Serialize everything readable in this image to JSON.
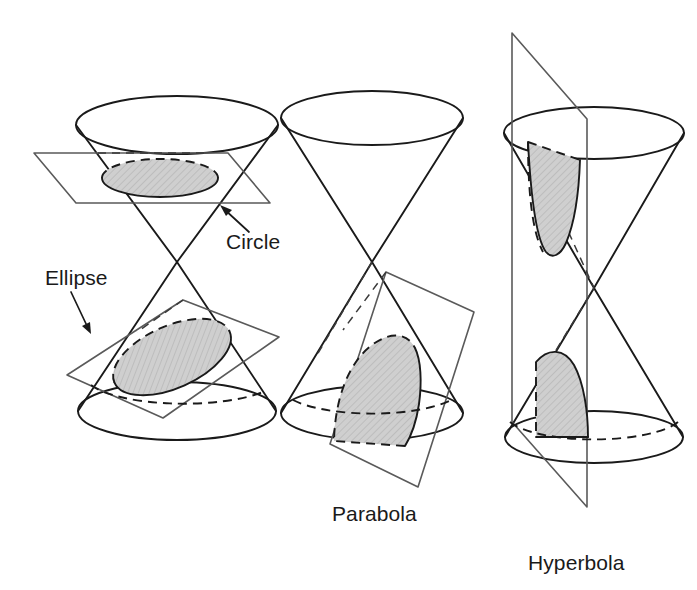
{
  "figure": {
    "background_color": "#ffffff",
    "line_color": "#1a1a1a",
    "plane_color": "#5a5a5a",
    "shade_color": "#c8c8c8",
    "panels": [
      {
        "id": "panel-circle-ellipse",
        "labels": [
          {
            "name": "circle-label",
            "text": "Circle",
            "x": 226,
            "y": 249,
            "anchor": "start"
          },
          {
            "name": "ellipse-label",
            "text": "Ellipse",
            "x": 45,
            "y": 285,
            "anchor": "start"
          }
        ],
        "leaders": [
          {
            "name": "circle-leader",
            "from_x": 249,
            "from_y": 232,
            "to_x": 222,
            "to_y": 206
          },
          {
            "name": "ellipse-leader",
            "from_x": 71,
            "from_y": 292,
            "to_x": 90,
            "to_y": 332
          }
        ],
        "cross_sections": [
          {
            "name": "circle-cross-section",
            "shape": "circle"
          },
          {
            "name": "ellipse-cross-section",
            "shape": "ellipse"
          }
        ],
        "planes": [
          {
            "name": "horizontal-cutting-plane"
          },
          {
            "name": "tilted-cutting-plane"
          }
        ]
      },
      {
        "id": "panel-parabola",
        "labels": [
          {
            "name": "parabola-label",
            "text": "Parabola",
            "x": 332,
            "y": 521,
            "anchor": "start"
          }
        ],
        "leaders": [],
        "cross_sections": [
          {
            "name": "parabola-cross-section",
            "shape": "parabola"
          }
        ],
        "planes": [
          {
            "name": "parallel-slant-cutting-plane"
          }
        ]
      },
      {
        "id": "panel-hyperbola",
        "labels": [
          {
            "name": "hyperbola-label",
            "text": "Hyperbola",
            "x": 528,
            "y": 570,
            "anchor": "start"
          }
        ],
        "leaders": [],
        "cross_sections": [
          {
            "name": "hyperbola-upper-branch",
            "shape": "hyperbola-branch"
          },
          {
            "name": "hyperbola-lower-branch",
            "shape": "hyperbola-branch"
          }
        ],
        "planes": [
          {
            "name": "vertical-cutting-plane"
          }
        ]
      }
    ]
  }
}
